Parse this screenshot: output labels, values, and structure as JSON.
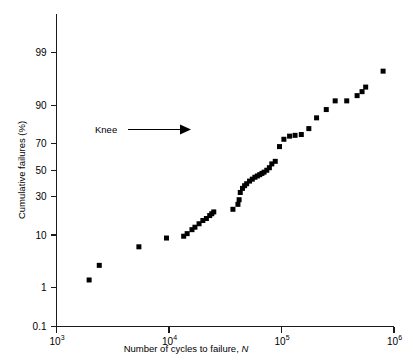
{
  "figure": {
    "faint_header": "",
    "background_color": "#ffffff",
    "ink_color": "#000000"
  },
  "annotations": [
    {
      "name": "knee-annotation",
      "label": "Knee",
      "arrow": "right-arrow"
    }
  ],
  "chart_data": {
    "type": "scatter",
    "title": "",
    "xlabel": "Number of cycles to failure, N",
    "ylabel": "Cumulative failures (%)",
    "xscale": "log10",
    "yscale": "probability",
    "xlim": [
      1000,
      1000000
    ],
    "ylim": [
      0.1,
      99.9
    ],
    "grid": false,
    "legend": null,
    "xticks": [
      1000,
      10000,
      100000,
      1000000
    ],
    "xtick_labels": [
      "10³",
      "10⁴",
      "10⁵",
      "10⁶"
    ],
    "xtick_bases": [
      "10",
      "10",
      "10",
      "10"
    ],
    "xtick_exponents": [
      "3",
      "4",
      "5",
      "6"
    ],
    "yticks": [
      99,
      90,
      70,
      50,
      30,
      10,
      1,
      0.1
    ],
    "ytick_labels": [
      "99",
      "90",
      "70",
      "50",
      "30",
      "10",
      "1",
      "0.1"
    ],
    "marker": "square",
    "marker_color": "#000000",
    "marker_size_px": 5,
    "series": [
      {
        "name": "Fatigue failures",
        "x": [
          1950,
          2400,
          5400,
          9500,
          13500,
          14500,
          16000,
          17000,
          18500,
          20000,
          21500,
          23000,
          24000,
          25000,
          37000,
          41000,
          42000,
          43000,
          45000,
          47000,
          49000,
          52000,
          55000,
          58000,
          61000,
          64000,
          67000,
          70000,
          74000,
          78000,
          82000,
          88000,
          96000,
          105000,
          118000,
          132000,
          150000,
          175000,
          205000,
          250000,
          300000,
          380000,
          470000,
          520000,
          560000,
          800000
        ],
        "y": [
          1.5,
          3.0,
          6.5,
          9.0,
          9.6,
          10.5,
          12.0,
          13.0,
          14.5,
          16.0,
          17.0,
          18.5,
          19.5,
          20.5,
          22.0,
          25.0,
          28.0,
          33.0,
          36.0,
          38.0,
          39.5,
          41.5,
          43.0,
          44.5,
          45.5,
          46.5,
          47.5,
          48.5,
          50.0,
          52.0,
          55.0,
          57.0,
          68.0,
          73.0,
          75.0,
          75.5,
          76.0,
          79.5,
          85.0,
          88.5,
          91.5,
          91.5,
          93.0,
          94.0,
          95.0,
          97.5
        ]
      }
    ]
  }
}
